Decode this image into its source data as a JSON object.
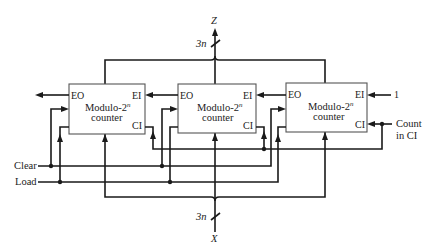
{
  "diagram": {
    "output_bus": {
      "label": "Z",
      "width_label": "3n"
    },
    "input_bus": {
      "label": "X",
      "width_label": "3n"
    },
    "counters": [
      {
        "title": "Modulo-2",
        "superscript": "n",
        "subtitle": "counter",
        "ports": {
          "eo": "EO",
          "ei": "EI",
          "ci": "CI"
        }
      },
      {
        "title": "Modulo-2",
        "superscript": "n",
        "subtitle": "counter",
        "ports": {
          "eo": "EO",
          "ei": "EI",
          "ci": "CI"
        }
      },
      {
        "title": "Modulo-2",
        "superscript": "n",
        "subtitle": "counter",
        "ports": {
          "eo": "EO",
          "ei": "EI",
          "ci": "CI"
        }
      }
    ],
    "signals": {
      "clear": "Clear",
      "load": "Load",
      "ei_constant": "1",
      "count_in_line1": "Count",
      "count_in_line2": "in CI"
    }
  }
}
